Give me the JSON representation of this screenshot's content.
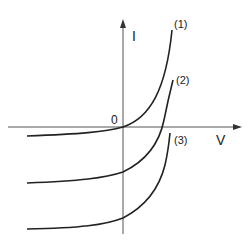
{
  "diagram": {
    "type": "I-V characteristic curves",
    "axes": {
      "y_label": "I",
      "x_label": "V",
      "origin_label": "0"
    },
    "curves": [
      {
        "id": "1",
        "label": "(1)"
      },
      {
        "id": "2",
        "label": "(2)"
      },
      {
        "id": "3",
        "label": "(3)"
      }
    ],
    "colors": {
      "line": "#222222",
      "axis": "#555555",
      "background": "#ffffff"
    }
  }
}
